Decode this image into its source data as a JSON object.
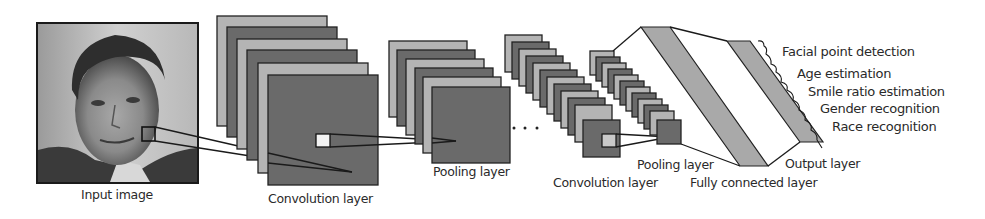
{
  "diagram": {
    "stages": [
      {
        "id": "input",
        "label": "Input image"
      },
      {
        "id": "conv1",
        "label": "Convolution layer"
      },
      {
        "id": "pool1",
        "label": "Pooling layer"
      },
      {
        "id": "ellipsis",
        "label": "· · ·"
      },
      {
        "id": "conv2",
        "label": "Convolution layer"
      },
      {
        "id": "pool2",
        "label": "Pooling layer"
      },
      {
        "id": "fc",
        "label": "Fully connected layer"
      },
      {
        "id": "output",
        "label": "Output layer"
      }
    ],
    "outputs": [
      "Facial point detection",
      "Age estimation",
      "Smile ratio estimation",
      "Gender recognition",
      "Race recognition"
    ],
    "colors": {
      "feature_map_light": "#b4b4b4",
      "feature_map_dark": "#6a6a6a",
      "band": "#a9a9a9",
      "stroke": "#222222",
      "background": "#ffffff"
    }
  }
}
